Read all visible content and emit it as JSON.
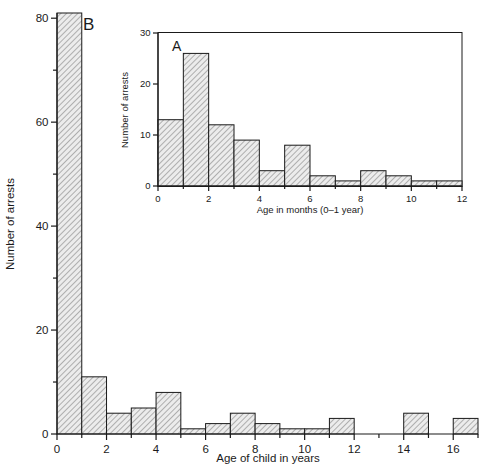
{
  "figure": {
    "title": "",
    "background_color": "#ffffff",
    "line_color": "#1a1a1a",
    "bar_fill_color": "#e8e8e8",
    "bar_hatch": "diagonal-lines"
  },
  "panel_b": {
    "letter": "B",
    "ylabel": "Number of arrests",
    "xlabel": "Age of child in years",
    "ytick_labels": [
      "0",
      "20",
      "40",
      "60",
      "80"
    ],
    "xtick_labels": [
      "0",
      "2",
      "4",
      "6",
      "8",
      "10",
      "12",
      "14",
      "16"
    ]
  },
  "panel_a": {
    "letter": "A",
    "ylabel": "Number of arrests",
    "xlabel": "Age in months (0–1 year)",
    "ytick_labels": [
      "0",
      "10",
      "20",
      "30"
    ],
    "xtick_labels": [
      "0",
      "2",
      "4",
      "6",
      "8",
      "10",
      "12"
    ]
  },
  "chart_data": [
    {
      "id": "panel-b",
      "type": "bar",
      "title": "B",
      "xlabel": "Age of child in years",
      "ylabel": "Number of arrests",
      "xlim": [
        0,
        17
      ],
      "ylim": [
        0,
        81
      ],
      "xticks": [
        0,
        2,
        4,
        6,
        8,
        10,
        12,
        14,
        16
      ],
      "xminorticks": [
        1,
        3,
        5,
        7,
        9,
        11,
        13,
        15,
        17
      ],
      "yticks": [
        0,
        20,
        40,
        60,
        80
      ],
      "yminorticks": [
        10,
        30,
        50,
        70
      ],
      "grid": false,
      "legend": "none",
      "bin_width": 1,
      "bin_edges": [
        0,
        1,
        2,
        3,
        4,
        5,
        6,
        7,
        8,
        9,
        10,
        11,
        12,
        13,
        14,
        15,
        16,
        17
      ],
      "categories": [
        "0-1",
        "1-2",
        "2-3",
        "3-4",
        "4-5",
        "5-6",
        "6-7",
        "7-8",
        "8-9",
        "9-10",
        "10-11",
        "11-12",
        "12-13",
        "13-14",
        "14-15",
        "15-16",
        "16-17"
      ],
      "values": [
        81,
        11,
        4,
        5,
        8,
        1,
        2,
        4,
        2,
        1,
        1,
        3,
        0,
        0,
        4,
        0,
        3
      ],
      "notes": "First bar is truncated at top of axis (value at or above 80)."
    },
    {
      "id": "panel-a",
      "type": "bar",
      "title": "A",
      "xlabel": "Age in months (0–1 year)",
      "ylabel": "Number of arrests",
      "xlim": [
        0,
        12
      ],
      "ylim": [
        0,
        30
      ],
      "xticks": [
        0,
        2,
        4,
        6,
        8,
        10,
        12
      ],
      "xminorticks": [
        1,
        3,
        5,
        7,
        9,
        11
      ],
      "yticks": [
        0,
        10,
        20,
        30
      ],
      "grid": false,
      "legend": "none",
      "bin_width": 1,
      "bin_edges": [
        0,
        1,
        2,
        3,
        4,
        5,
        6,
        7,
        8,
        9,
        10,
        11,
        12
      ],
      "categories": [
        "0-1",
        "1-2",
        "2-3",
        "3-4",
        "4-5",
        "5-6",
        "6-7",
        "7-8",
        "8-9",
        "9-10",
        "10-11",
        "11-12"
      ],
      "values": [
        13,
        26,
        12,
        9,
        3,
        8,
        2,
        1,
        3,
        2,
        1,
        1
      ]
    }
  ]
}
